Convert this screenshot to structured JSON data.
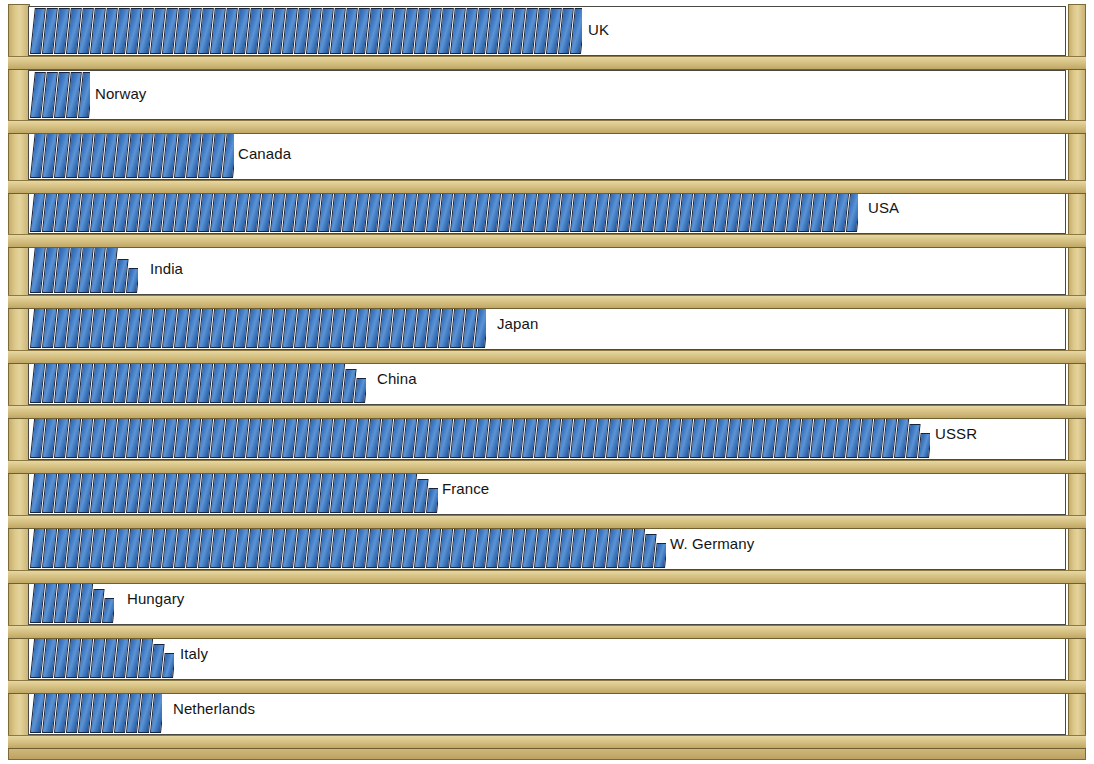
{
  "chart_data": {
    "type": "bar",
    "title": "",
    "subtitle": "",
    "xlabel": "",
    "ylabel": "",
    "orientation": "horizontal",
    "style": "pictorial-bookshelf",
    "grid": false,
    "legend": null,
    "unit": "books (each icon = 1 unit)",
    "xlim": [
      0,
      86
    ],
    "categories": [
      "UK",
      "Norway",
      "Canada",
      "USA",
      "India",
      "Japan",
      "China",
      "USSR",
      "France",
      "W. Germany",
      "Hungary",
      "Italy",
      "Netherlands"
    ],
    "values": [
      46,
      5,
      17,
      70,
      10,
      39,
      29,
      76,
      34,
      53,
      8,
      12,
      11
    ],
    "bar_end_px": [
      578,
      85,
      228,
      858,
      140,
      487,
      367,
      925,
      432,
      660,
      117,
      170,
      163
    ],
    "colors": {
      "book_fill": "#3f7ac4",
      "book_outline": "#14233f",
      "shelf_wood": "#d9c487",
      "shelf_wood_dark": "#c0a765",
      "frame_outline": "#7d6a38",
      "background": "#ffffff",
      "label_text": "#141414"
    },
    "rows": [
      {
        "label": "UK",
        "value": 46,
        "books": 46,
        "partial": false,
        "end_px": 578,
        "top": 6,
        "height": 50
      },
      {
        "label": "Norway",
        "value": 5,
        "books": 5,
        "partial": false,
        "end_px": 85,
        "top": 70,
        "height": 50
      },
      {
        "label": "Canada",
        "value": 17,
        "books": 17,
        "partial": false,
        "end_px": 228,
        "top": 130,
        "height": 50
      },
      {
        "label": "USA",
        "value": 70,
        "books": 70,
        "partial": false,
        "end_px": 858,
        "top": 184,
        "height": 50
      },
      {
        "label": "India",
        "value": 10,
        "books": 9,
        "partial": true,
        "end_px": 140,
        "top": 245,
        "height": 50
      },
      {
        "label": "Japan",
        "value": 39,
        "books": 39,
        "partial": false,
        "end_px": 487,
        "top": 300,
        "height": 50
      },
      {
        "label": "China",
        "value": 29,
        "books": 28,
        "partial": true,
        "end_px": 367,
        "top": 355,
        "height": 50
      },
      {
        "label": "USSR",
        "value": 76,
        "books": 75,
        "partial": true,
        "end_px": 925,
        "top": 410,
        "height": 50
      },
      {
        "label": "France",
        "value": 34,
        "books": 33,
        "partial": true,
        "end_px": 432,
        "top": 465,
        "height": 50
      },
      {
        "label": "W. Germany",
        "value": 53,
        "books": 52,
        "partial": true,
        "end_px": 660,
        "top": 520,
        "height": 50
      },
      {
        "label": "Hungary",
        "value": 8,
        "books": 7,
        "partial": true,
        "end_px": 117,
        "top": 575,
        "height": 50
      },
      {
        "label": "Italy",
        "value": 12,
        "books": 11,
        "partial": true,
        "end_px": 170,
        "top": 630,
        "height": 50
      },
      {
        "label": "Netherlands",
        "value": 11,
        "books": 11,
        "partial": false,
        "end_px": 163,
        "top": 685,
        "height": 50
      }
    ]
  }
}
